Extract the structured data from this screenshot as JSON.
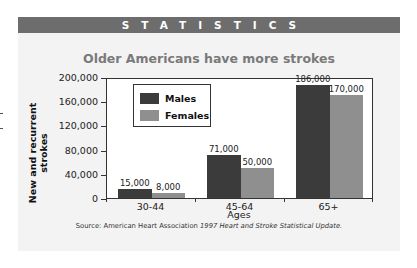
{
  "header": {
    "label": "STATISTICS"
  },
  "chart_data": {
    "type": "bar",
    "title": "Older Americans have more strokes",
    "xlabel": "Ages",
    "ylabel": "New and recurrent strokes",
    "categories": [
      "30-44",
      "45-64",
      "65+"
    ],
    "series": [
      {
        "name": "Males",
        "values": [
          15000,
          71000,
          186000
        ],
        "color": "#3b3b3b",
        "labels": [
          "15,000",
          "71,000",
          "186,000"
        ]
      },
      {
        "name": "Females",
        "values": [
          8000,
          50000,
          170000
        ],
        "color": "#8f8f8f",
        "labels": [
          "8,000",
          "50,000",
          "170,000"
        ]
      }
    ],
    "ylim": [
      0,
      200000
    ],
    "yticks": [
      0,
      40000,
      80000,
      120000,
      160000,
      200000
    ],
    "ytick_labels": [
      "0",
      "40,000",
      "80,000",
      "120,000",
      "160,000",
      "200,000"
    ],
    "grid": false,
    "legend_position": "upper-left inside plot"
  },
  "source": {
    "prefix": "Source: American Heart Association ",
    "italic": "1997 Heart and Stroke Statistical Update."
  }
}
